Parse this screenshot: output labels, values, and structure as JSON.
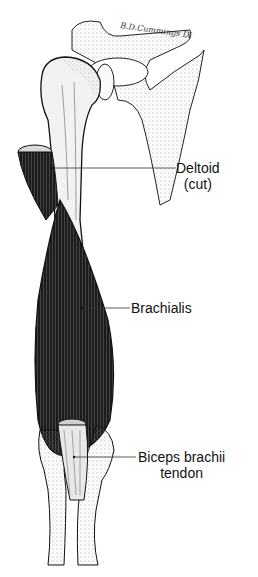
{
  "figure": {
    "type": "anatomical-illustration",
    "signature": "B.D.Cummings IX",
    "colors": {
      "ink": "#111111",
      "muscle": "#1a1a1a",
      "bone": "#f4f4f4",
      "stipple": "#9a9a9a",
      "background": "#ffffff"
    }
  },
  "labels": [
    {
      "id": "deltoid",
      "line1": "Deltoid",
      "line2": "(cut)"
    },
    {
      "id": "brachialis",
      "line1": "Brachialis"
    },
    {
      "id": "biceps",
      "line1": "Biceps brachii",
      "line2": "tendon"
    }
  ]
}
